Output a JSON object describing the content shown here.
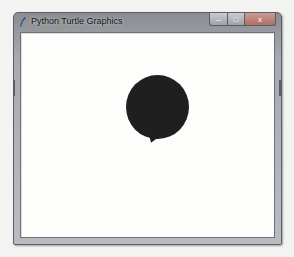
{
  "window": {
    "title": "Python Turtle Graphics",
    "icon": "feather-icon",
    "controls": {
      "minimize": "–",
      "maximize": "□",
      "close": "x"
    }
  },
  "canvas": {
    "background": "#fdfdfc",
    "shape": {
      "type": "filled-circle",
      "color": "#1f1f1f"
    },
    "turtle": {
      "shape": "arrow",
      "color": "#1f1f1f"
    }
  },
  "caption": {
    "text": ""
  }
}
